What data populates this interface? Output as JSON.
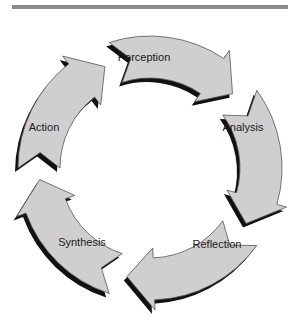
{
  "diagram": {
    "type": "cycle",
    "colors": {
      "fill": "#cfcfcf",
      "stroke": "#555555",
      "shadow": "#111111",
      "bar": "#8a8a8a"
    },
    "center": [
      150,
      168
    ],
    "outer_radius": 132,
    "inner_radius": 90,
    "steps": [
      {
        "label": "Perception",
        "start": 252,
        "end": 318,
        "lx": 144,
        "ly": 61
      },
      {
        "label": "Analysis",
        "start": 324,
        "end": 30,
        "lx": 243,
        "ly": 131
      },
      {
        "label": "Reflection",
        "start": 36,
        "end": 102,
        "lx": 217,
        "ly": 248
      },
      {
        "label": "Synthesis",
        "start": 108,
        "end": 174,
        "lx": 82,
        "ly": 246
      },
      {
        "label": "Action",
        "start": 180,
        "end": 246,
        "lx": 44,
        "ly": 131
      }
    ]
  }
}
